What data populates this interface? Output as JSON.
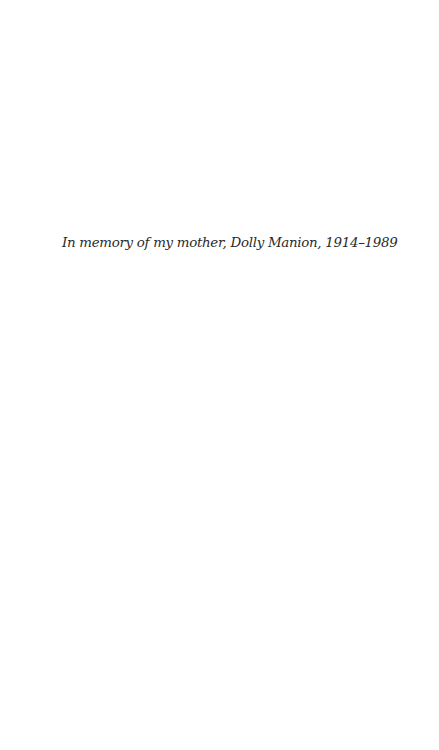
{
  "page": {
    "dedication": "In memory of my mother, Dolly Manion, 1914–1989"
  }
}
